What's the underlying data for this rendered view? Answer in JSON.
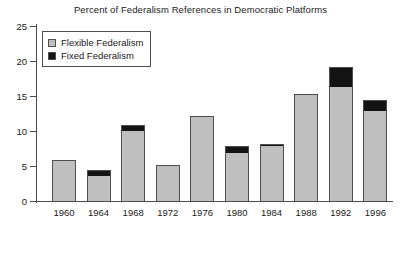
{
  "chart_data": {
    "type": "bar",
    "title": "Percent of Federalism References in Democratic Platforms",
    "xlabel": "",
    "ylabel": "",
    "ylim": [
      0,
      25
    ],
    "yticks": [
      0,
      5,
      10,
      15,
      20,
      25
    ],
    "grid": false,
    "stacked": true,
    "legend_position": "top-left",
    "categories": [
      "1960",
      "1964",
      "1968",
      "1972",
      "1976",
      "1980",
      "1984",
      "1988",
      "1992",
      "1996"
    ],
    "series": [
      {
        "name": "Flexible Federalism",
        "color": "#bfbfbf",
        "values": [
          5.9,
          3.6,
          10.0,
          5.0,
          12.2,
          6.9,
          7.8,
          15.3,
          16.3,
          12.8
        ]
      },
      {
        "name": "Fixed Federalism",
        "color": "#141414",
        "values": [
          0.0,
          0.8,
          0.9,
          0.2,
          0.0,
          1.0,
          0.4,
          0.0,
          2.8,
          1.6
        ]
      }
    ],
    "totals": [
      5.9,
      4.4,
      10.9,
      5.2,
      12.2,
      7.9,
      8.2,
      15.3,
      19.1,
      14.4
    ]
  },
  "legend": {
    "items": [
      {
        "label": "Flexible Federalism",
        "swatch": "flexible"
      },
      {
        "label": "Fixed Federalism",
        "swatch": "fixed"
      }
    ]
  }
}
